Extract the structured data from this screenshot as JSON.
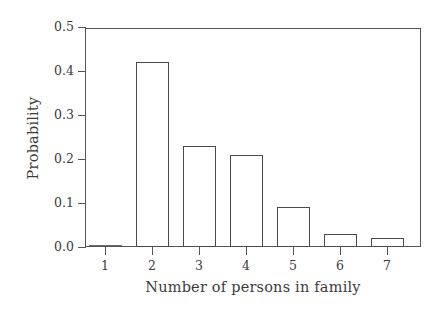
{
  "chart_data": {
    "type": "bar",
    "title": "",
    "xlabel": "Number of persons in family",
    "ylabel": "Probability",
    "categories": [
      "1",
      "2",
      "3",
      "4",
      "5",
      "6",
      "7"
    ],
    "values": [
      0.0,
      0.42,
      0.23,
      0.21,
      0.09,
      0.03,
      0.02
    ],
    "series": [
      {
        "name": "Probability",
        "values": [
          0.0,
          0.42,
          0.23,
          0.21,
          0.09,
          0.03,
          0.02
        ]
      }
    ],
    "ylim": [
      0.0,
      0.5
    ],
    "ytick_labels": [
      "0.0",
      "0.1",
      "0.2",
      "0.3",
      "0.4",
      "0.5"
    ],
    "ytick_values": [
      0.0,
      0.1,
      0.2,
      0.3,
      0.4,
      0.5
    ],
    "xtick_labels": [
      "1",
      "2",
      "3",
      "4",
      "5",
      "6",
      "7"
    ],
    "grid": false,
    "legend": "none",
    "bar_style": "hollow-outline",
    "colors": {
      "bar_outline": "#4a4a4a",
      "bar_fill": "#ffffff",
      "axis": "#555555",
      "text": "#3c3c3c",
      "background": "#ffffff"
    }
  }
}
